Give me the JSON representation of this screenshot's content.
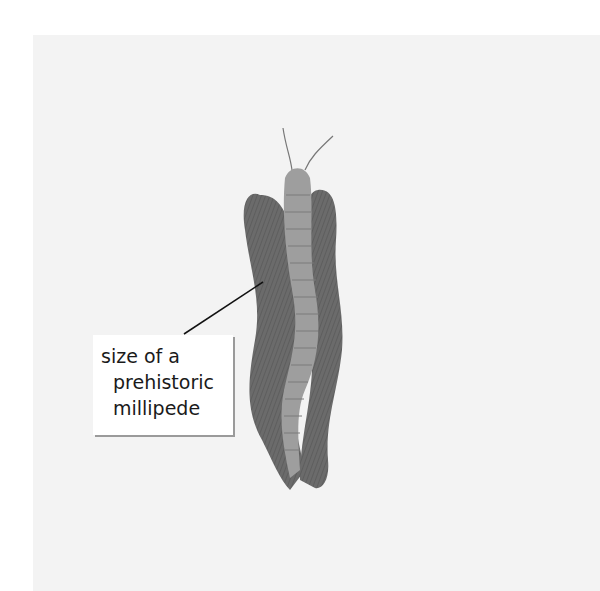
{
  "illustration": {
    "subject": "prehistoric millipede",
    "background_color": "#f3f3f3",
    "body_colors": {
      "dark_legs": "#6f6f6f",
      "body": "#9c9c9c",
      "body_light": "#b0b0b0"
    }
  },
  "label": {
    "lines": [
      "size of a",
      "prehistoric",
      "millipede"
    ]
  }
}
